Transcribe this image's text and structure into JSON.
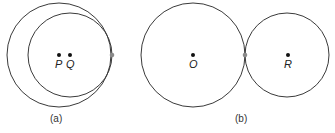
{
  "figure": {
    "panel_a": {
      "caption": "(a)",
      "description": "Internally tangent circles",
      "outer_circle": {
        "cx": 59,
        "cy": 55,
        "r": 52
      },
      "inner_circle": {
        "cx": 70,
        "cy": 55,
        "r": 42
      },
      "centers": [
        {
          "label": "P",
          "x": 59,
          "y": 55
        },
        {
          "label": "Q",
          "x": 70,
          "y": 55
        }
      ],
      "tangent_point": {
        "x": 112,
        "y": 55
      }
    },
    "panel_b": {
      "caption": "(b)",
      "description": "Externally tangent circles",
      "left_circle": {
        "cx": 193,
        "cy": 55,
        "r": 52
      },
      "right_circle": {
        "cx": 287,
        "cy": 55,
        "r": 42
      },
      "centers": [
        {
          "label": "O",
          "x": 193,
          "y": 55
        },
        {
          "label": "R",
          "x": 287,
          "y": 55
        }
      ],
      "tangent_point": {
        "x": 245,
        "y": 55
      }
    }
  }
}
